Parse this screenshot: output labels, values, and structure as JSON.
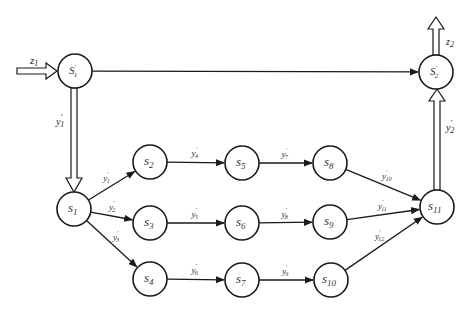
{
  "diagram": {
    "nodes": [
      {
        "id": "S1p",
        "base": "S",
        "sub": "1",
        "prime": true,
        "x": 75,
        "y": 71
      },
      {
        "id": "S2p",
        "base": "S",
        "sub": "2",
        "prime": true,
        "x": 436,
        "y": 72
      },
      {
        "id": "s1",
        "base": "s",
        "sub": "1",
        "prime": false,
        "x": 74,
        "y": 209
      },
      {
        "id": "s2",
        "base": "s",
        "sub": "2",
        "prime": false,
        "x": 150,
        "y": 162
      },
      {
        "id": "s3",
        "base": "s",
        "sub": "3",
        "prime": false,
        "x": 150,
        "y": 223
      },
      {
        "id": "s4",
        "base": "s",
        "sub": "4",
        "prime": false,
        "x": 150,
        "y": 279
      },
      {
        "id": "s5",
        "base": "s",
        "sub": "5",
        "prime": false,
        "x": 242,
        "y": 163
      },
      {
        "id": "s6",
        "base": "s",
        "sub": "6",
        "prime": false,
        "x": 242,
        "y": 223
      },
      {
        "id": "s7",
        "base": "s",
        "sub": "7",
        "prime": false,
        "x": 242,
        "y": 280
      },
      {
        "id": "s8",
        "base": "s",
        "sub": "8",
        "prime": false,
        "x": 330,
        "y": 163
      },
      {
        "id": "s9",
        "base": "s",
        "sub": "9",
        "prime": false,
        "x": 330,
        "y": 222
      },
      {
        "id": "s10",
        "base": "s",
        "sub": "10",
        "prime": false,
        "x": 331,
        "y": 280
      },
      {
        "id": "s11",
        "base": "s",
        "sub": "11",
        "prime": false,
        "x": 437,
        "y": 207
      }
    ],
    "labels": {
      "z1": {
        "base": "z",
        "sub": "1"
      },
      "z2": {
        "base": "z",
        "sub": "2"
      },
      "y1_left": {
        "base": "y",
        "sub": "1"
      },
      "y2_right": {
        "base": "y",
        "sub": "2"
      }
    },
    "edges": [
      {
        "from": "S1p",
        "to": "S2p",
        "label": ""
      },
      {
        "from": "s1",
        "to": "s2",
        "label": "1"
      },
      {
        "from": "s1",
        "to": "s3",
        "label": "2"
      },
      {
        "from": "s1",
        "to": "s4",
        "label": "3"
      },
      {
        "from": "s2",
        "to": "s5",
        "label": "4"
      },
      {
        "from": "s3",
        "to": "s6",
        "label": "5"
      },
      {
        "from": "s4",
        "to": "s7",
        "label": "6"
      },
      {
        "from": "s5",
        "to": "s8",
        "label": "7"
      },
      {
        "from": "s6",
        "to": "s9",
        "label": "8"
      },
      {
        "from": "s7",
        "to": "s10",
        "label": "9"
      },
      {
        "from": "s8",
        "to": "s11",
        "label": "10"
      },
      {
        "from": "s9",
        "to": "s11",
        "label": "11"
      },
      {
        "from": "s10",
        "to": "s11",
        "label": "12"
      }
    ],
    "double_arrows": [
      {
        "id": "in-z1",
        "label": "z1"
      },
      {
        "id": "S1p-to-s1",
        "label": "y1_left"
      },
      {
        "id": "s11-to-S2p",
        "label": "y2_right"
      },
      {
        "id": "out-z2",
        "label": "z2"
      }
    ]
  }
}
